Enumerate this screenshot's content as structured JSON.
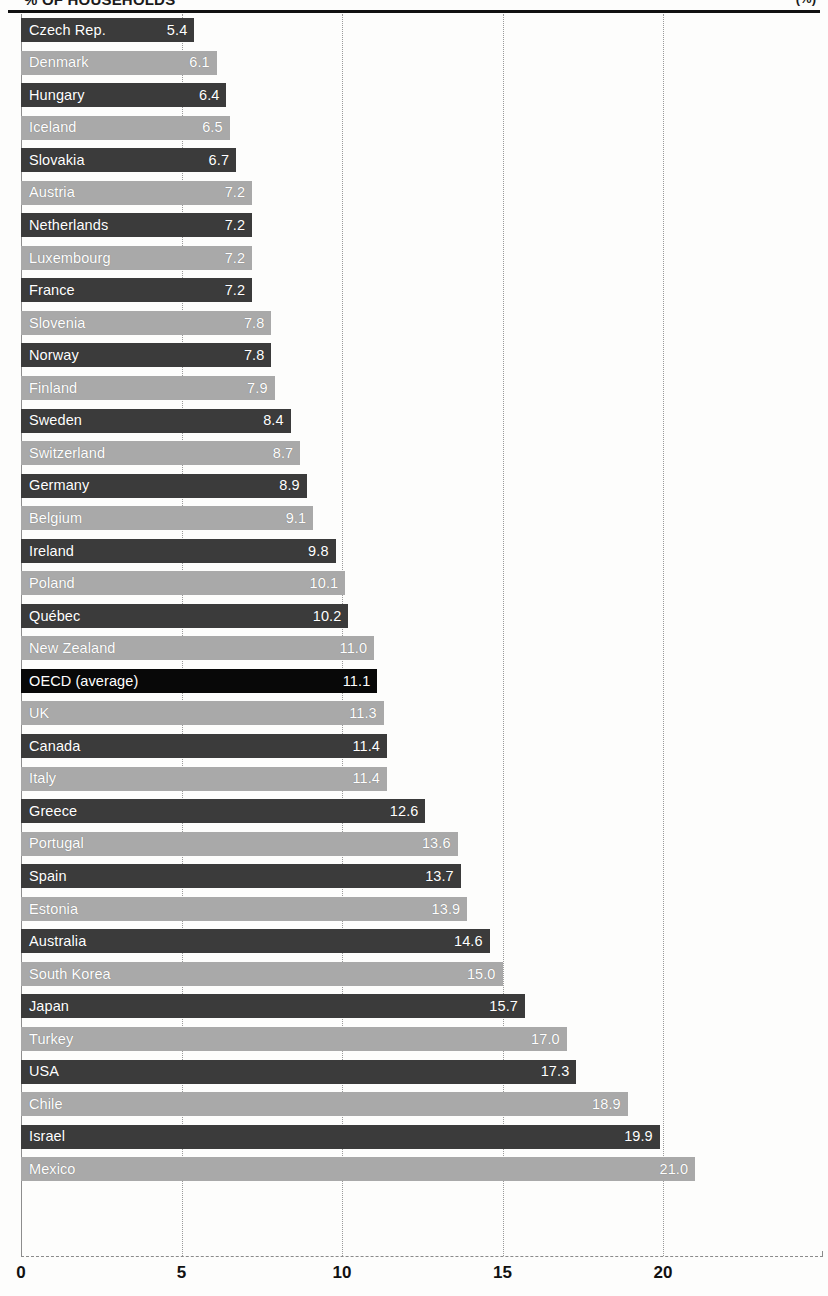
{
  "header": {
    "title_clipped": "% OF HOUSEHOLDS",
    "title_right_clipped": "(%)"
  },
  "axis": {
    "x_ticks": [
      "0",
      "5",
      "10",
      "15",
      "20"
    ],
    "x_tick_values": [
      0,
      5,
      10,
      15,
      20
    ],
    "x_min": 0,
    "x_max": 25
  },
  "chart_data": {
    "type": "bar",
    "orientation": "horizontal",
    "title": "% OF HOUSEHOLDS",
    "xlabel": "",
    "ylabel": "",
    "xlim": [
      0,
      25
    ],
    "grid": true,
    "gridlines_at": [
      0,
      5,
      10,
      15,
      20
    ],
    "legend": null,
    "categories": [
      "Czech Rep.",
      "Denmark",
      "Hungary",
      "Iceland",
      "Slovakia",
      "Austria",
      "Netherlands",
      "Luxembourg",
      "France",
      "Slovenia",
      "Norway",
      "Finland",
      "Sweden",
      "Switzerland",
      "Germany",
      "Belgium",
      "Ireland",
      "Poland",
      "Québec",
      "New Zealand",
      "OECD (average)",
      "UK",
      "Canada",
      "Italy",
      "Greece",
      "Portugal",
      "Spain",
      "Estonia",
      "Australia",
      "South Korea",
      "Japan",
      "Turkey",
      "USA",
      "Chile",
      "Israel",
      "Mexico"
    ],
    "values": [
      5.4,
      6.1,
      6.4,
      6.5,
      6.7,
      7.2,
      7.2,
      7.2,
      7.2,
      7.8,
      7.8,
      7.9,
      8.4,
      8.7,
      8.9,
      9.1,
      9.8,
      10.1,
      10.2,
      11.0,
      11.1,
      11.3,
      11.4,
      11.4,
      12.6,
      13.6,
      13.7,
      13.9,
      14.6,
      15.0,
      15.7,
      17.0,
      17.3,
      18.9,
      19.9,
      21.0
    ],
    "value_labels": [
      "5.4",
      "6.1",
      "6.4",
      "6.5",
      "6.7",
      "7.2",
      "7.2",
      "7.2",
      "7.2",
      "7.8",
      "7.8",
      "7.9",
      "8.4",
      "8.7",
      "8.9",
      "9.1",
      "9.8",
      "10.1",
      "10.2",
      "11.0",
      "11.1",
      "11.3",
      "11.4",
      "11.4",
      "12.6",
      "13.6",
      "13.7",
      "13.9",
      "14.6",
      "15.0",
      "15.7",
      "17.0",
      "17.3",
      "18.9",
      "19.9",
      "21.0"
    ],
    "bar_shades": [
      "dark",
      "light",
      "dark",
      "light",
      "dark",
      "light",
      "dark",
      "light",
      "dark",
      "light",
      "dark",
      "light",
      "dark",
      "light",
      "dark",
      "light",
      "dark",
      "light",
      "dark",
      "light",
      "black",
      "light",
      "dark",
      "light",
      "dark",
      "light",
      "dark",
      "light",
      "dark",
      "light",
      "dark",
      "light",
      "dark",
      "light",
      "dark",
      "light"
    ],
    "highlight_category": "OECD (average)"
  },
  "colors": {
    "bar_dark": "#3b3b3b",
    "bar_light": "#a9a9a9",
    "bar_highlight": "#080808",
    "label_text": "#ffffff",
    "axis_text": "#111111",
    "gridline": "#9a9a9a",
    "background": "#fdfdfc"
  }
}
